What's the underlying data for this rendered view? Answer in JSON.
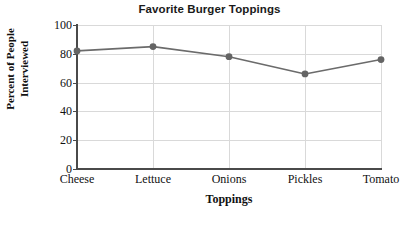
{
  "chart_data": {
    "type": "line",
    "title": "Favorite Burger Toppings",
    "xlabel": "Toppings",
    "ylabel": "Percent of People Interviewed",
    "ylabel_lines": [
      "Percent of People",
      "Interviewed"
    ],
    "categories": [
      "Cheese",
      "Lettuce",
      "Onions",
      "Pickles",
      "Tomato"
    ],
    "values": [
      82,
      85,
      78,
      66,
      76
    ],
    "ylim": [
      0,
      100
    ],
    "ytick_labels": [
      "0",
      "20",
      "40",
      "60",
      "80",
      "100"
    ],
    "ytick_values": [
      0,
      20,
      40,
      60,
      80,
      100
    ],
    "grid": true,
    "legend": false,
    "series": [
      {
        "name": "Percent of People Interviewed",
        "values": [
          82,
          85,
          78,
          66,
          76
        ]
      }
    ],
    "colors": {
      "line": "#6b6b6b",
      "marker": "#646464",
      "gridline": "#d9d9d9",
      "axis": "#4a4a4a",
      "text": "#111111",
      "title": "#1a1a1a",
      "background": "#ffffff"
    }
  }
}
